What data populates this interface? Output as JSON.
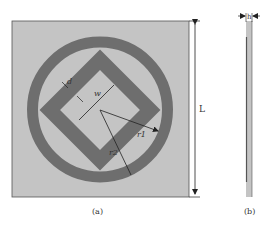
{
  "figure": {
    "panel_a": {
      "caption": "(a)",
      "labels": {
        "d": "d",
        "w": "w",
        "r1": "r1",
        "r2": "r2",
        "L": "L"
      }
    },
    "panel_b": {
      "caption": "(b)",
      "labels": {
        "h": "h"
      }
    }
  },
  "colors": {
    "substrate": "#c4c4c4",
    "metal": "#6e6e6e",
    "outline": "#555555",
    "dimension_line": "#222222",
    "background": "#ffffff"
  }
}
